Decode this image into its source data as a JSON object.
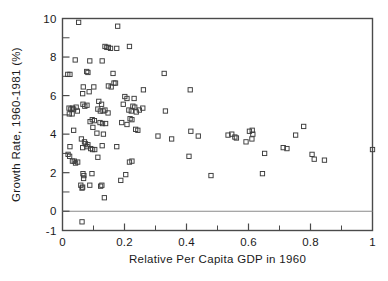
{
  "chart_data": {
    "type": "scatter",
    "title": "",
    "xlabel": "Relative Per Capita GDP in 1960",
    "ylabel": "Growth Rate, 1960-1981 (%)",
    "xlim": [
      0,
      1
    ],
    "ylim": [
      -1,
      10
    ],
    "grid": false,
    "legend": null,
    "x_ticks": [
      0,
      0.2,
      0.4,
      0.6,
      0.8,
      1
    ],
    "x_tick_labels": [
      "0",
      "0.2",
      "0.4",
      "0.6",
      "0.8",
      "1"
    ],
    "x_minor_ticks": [
      0.1,
      0.3,
      0.5,
      0.7,
      0.9
    ],
    "y_ticks": [
      -1,
      0,
      2,
      4,
      6,
      8,
      10
    ],
    "y_tick_labels": [
      "-1",
      "0",
      "2",
      "4",
      "6",
      "8",
      "10"
    ],
    "y_minor_ticks": [
      1,
      3,
      5,
      7,
      9
    ],
    "marker_style": "open-square",
    "marker_color": "#3b3b3b",
    "zero_reference_line": 0,
    "points": [
      [
        0.052,
        9.8
      ],
      [
        0.178,
        9.6
      ],
      [
        0.137,
        8.55
      ],
      [
        0.143,
        8.5
      ],
      [
        0.148,
        8.5
      ],
      [
        0.155,
        8.45
      ],
      [
        0.175,
        8.45
      ],
      [
        0.216,
        8.55
      ],
      [
        0.041,
        7.85
      ],
      [
        0.088,
        7.8
      ],
      [
        0.128,
        7.8
      ],
      [
        0.017,
        7.1
      ],
      [
        0.024,
        7.1
      ],
      [
        0.078,
        7.25
      ],
      [
        0.082,
        7.2
      ],
      [
        0.163,
        7.15
      ],
      [
        0.328,
        7.15
      ],
      [
        0.067,
        6.45
      ],
      [
        0.086,
        6.2
      ],
      [
        0.101,
        6.45
      ],
      [
        0.148,
        6.5
      ],
      [
        0.157,
        6.45
      ],
      [
        0.166,
        6.65
      ],
      [
        0.171,
        6.65
      ],
      [
        0.261,
        6.3
      ],
      [
        0.412,
        6.3
      ],
      [
        0.065,
        6.1
      ],
      [
        0.201,
        5.95
      ],
      [
        0.208,
        5.85
      ],
      [
        0.231,
        5.85
      ],
      [
        0.066,
        5.55
      ],
      [
        0.072,
        5.45
      ],
      [
        0.079,
        5.5
      ],
      [
        0.117,
        5.7
      ],
      [
        0.126,
        5.55
      ],
      [
        0.196,
        5.55
      ],
      [
        0.227,
        5.45
      ],
      [
        0.233,
        5.4
      ],
      [
        0.021,
        5.35
      ],
      [
        0.027,
        5.3
      ],
      [
        0.032,
        5.35
      ],
      [
        0.036,
        5.3
      ],
      [
        0.044,
        5.4
      ],
      [
        0.048,
        5.2
      ],
      [
        0.022,
        5.05
      ],
      [
        0.031,
        5.05
      ],
      [
        0.114,
        5.3
      ],
      [
        0.122,
        5.2
      ],
      [
        0.131,
        5.2
      ],
      [
        0.137,
        5.25
      ],
      [
        0.147,
        5.1
      ],
      [
        0.214,
        5.25
      ],
      [
        0.222,
        5.2
      ],
      [
        0.238,
        5.15
      ],
      [
        0.248,
        5.25
      ],
      [
        0.259,
        5.35
      ],
      [
        0.332,
        5.2
      ],
      [
        0.096,
        4.75
      ],
      [
        0.103,
        4.7
      ],
      [
        0.089,
        4.65
      ],
      [
        0.121,
        4.6
      ],
      [
        0.129,
        4.55
      ],
      [
        0.139,
        4.55
      ],
      [
        0.191,
        4.6
      ],
      [
        0.208,
        4.5
      ],
      [
        0.218,
        4.8
      ],
      [
        0.224,
        4.75
      ],
      [
        0.036,
        4.2
      ],
      [
        0.098,
        4.35
      ],
      [
        0.111,
        4.05
      ],
      [
        0.132,
        4.0
      ],
      [
        0.236,
        4.25
      ],
      [
        0.243,
        4.2
      ],
      [
        0.414,
        4.15
      ],
      [
        0.534,
        3.95
      ],
      [
        0.546,
        4.0
      ],
      [
        0.556,
        3.85
      ],
      [
        0.561,
        3.8
      ],
      [
        0.603,
        4.15
      ],
      [
        0.612,
        4.2
      ],
      [
        0.614,
        4.0
      ],
      [
        0.752,
        3.95
      ],
      [
        0.778,
        4.4
      ],
      [
        0.024,
        3.35
      ],
      [
        0.061,
        3.75
      ],
      [
        0.071,
        3.6
      ],
      [
        0.074,
        3.5
      ],
      [
        0.079,
        3.35
      ],
      [
        0.082,
        3.45
      ],
      [
        0.065,
        3.3
      ],
      [
        0.091,
        3.25
      ],
      [
        0.097,
        3.2
      ],
      [
        0.104,
        3.2
      ],
      [
        0.128,
        3.4
      ],
      [
        0.175,
        3.35
      ],
      [
        0.308,
        3.9
      ],
      [
        0.352,
        3.75
      ],
      [
        0.438,
        3.9
      ],
      [
        0.592,
        3.6
      ],
      [
        0.611,
        3.75
      ],
      [
        0.712,
        3.3
      ],
      [
        0.724,
        3.25
      ],
      [
        0.018,
        2.95
      ],
      [
        0.023,
        2.85
      ],
      [
        0.032,
        2.6
      ],
      [
        0.038,
        2.6
      ],
      [
        0.042,
        2.5
      ],
      [
        0.049,
        2.55
      ],
      [
        0.114,
        2.8
      ],
      [
        0.216,
        2.55
      ],
      [
        0.224,
        2.6
      ],
      [
        0.408,
        2.85
      ],
      [
        0.652,
        3.0
      ],
      [
        0.805,
        2.95
      ],
      [
        0.812,
        2.7
      ],
      [
        0.845,
        2.65
      ],
      [
        1.0,
        3.2
      ],
      [
        0.066,
        1.95
      ],
      [
        0.069,
        1.85
      ],
      [
        0.068,
        1.7
      ],
      [
        0.095,
        1.95
      ],
      [
        0.204,
        1.9
      ],
      [
        0.479,
        1.85
      ],
      [
        0.645,
        1.95
      ],
      [
        0.059,
        1.35
      ],
      [
        0.063,
        1.2
      ],
      [
        0.065,
        1.25
      ],
      [
        0.088,
        1.35
      ],
      [
        0.123,
        1.3
      ],
      [
        0.127,
        1.35
      ],
      [
        0.188,
        1.6
      ],
      [
        0.135,
        0.7
      ],
      [
        0.063,
        -0.55
      ]
    ]
  }
}
